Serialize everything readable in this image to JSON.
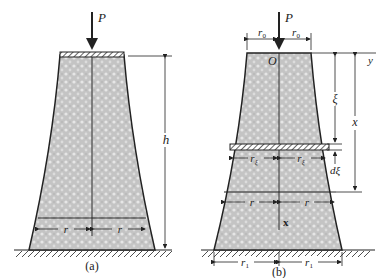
{
  "figure": {
    "panels": [
      {
        "id": "a",
        "caption": "(a)",
        "load_label": "P",
        "height_label": "h",
        "radius_left_label": "r",
        "radius_right_label": "r"
      },
      {
        "id": "b",
        "caption": "(b)",
        "load_label": "P",
        "origin_label": "O",
        "y_axis_label": "y",
        "x_axis_label": "x",
        "top_radius_left_label": "r₀",
        "top_radius_right_label": "r₀",
        "xi_label": "ξ",
        "x_dim_label": "x",
        "dxi_label": "dξ",
        "rxi_left_label": "r_ξ",
        "rxi_right_label": "r_ξ",
        "radius_left_label": "r",
        "radius_right_label": "r",
        "base_radius_left_label": "r₁",
        "base_radius_right_label": "r₁"
      }
    ],
    "colors": {
      "fill": "#c9c9c9",
      "stroke": "#222222",
      "background": "#ffffff"
    }
  }
}
